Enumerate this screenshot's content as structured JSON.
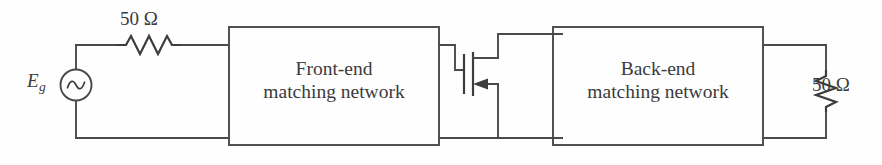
{
  "figure": {
    "kind": "circuit-schematic",
    "title_visible": false,
    "background_color": "#fefefe",
    "line_color": "#4a4a4a",
    "text_color": "#3b3b3b"
  },
  "source": {
    "name": "ac-voltage-source",
    "label": "E",
    "label_subscript": "g",
    "symbol": "sine-wave-circle"
  },
  "series_resistor": {
    "name": "source-resistor",
    "label": "50 Ω",
    "orientation": "horizontal",
    "symbol": "zigzag-resistor"
  },
  "load_resistor": {
    "name": "load-resistor",
    "label": "50 Ω",
    "orientation": "vertical",
    "symbol": "zigzag-resistor"
  },
  "blocks": [
    {
      "name": "front-end-matching-network",
      "line1": "Front-end",
      "line2": "matching network"
    },
    {
      "name": "back-end-matching-network",
      "line1": "Back-end",
      "line2": "matching network"
    }
  ],
  "transistor": {
    "name": "fet-transistor",
    "symbol": "field-effect-transistor",
    "terminals": [
      "gate",
      "drain",
      "source"
    ],
    "arrow_on": "source"
  }
}
